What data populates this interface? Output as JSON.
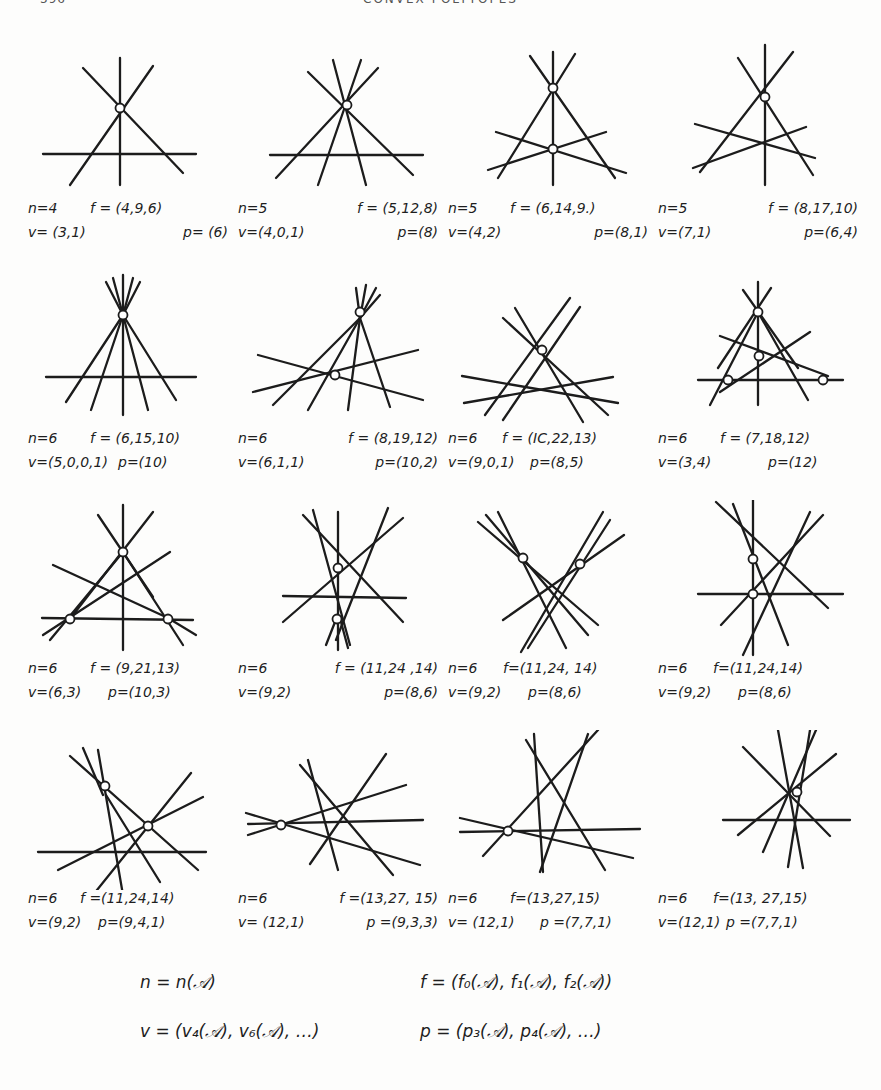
{
  "header": {
    "page_number": "396",
    "running_title": "CONVEX POLYTOPES"
  },
  "figures": [
    {
      "n": "n=4",
      "f": "f = (4,9,6)",
      "v": "v= (3,1)",
      "p": "p= (6)",
      "lines": [
        [
          45,
          115,
          160,
          115
        ],
        [
          95,
          20,
          95,
          160
        ],
        [
          50,
          40,
          165,
          125
        ],
        [
          125,
          40,
          40,
          145
        ]
      ],
      "points": [
        [
          95,
          68
        ]
      ]
    },
    {
      "n": "n=5",
      "f": "f = (5,12,8)",
      "v": "v=(4,0,1)",
      "p": "p=(8)",
      "lines": [
        [
          30,
          115,
          185,
          115
        ],
        [
          60,
          30,
          165,
          135
        ],
        [
          120,
          28,
          50,
          138
        ],
        [
          90,
          20,
          135,
          145
        ],
        [
          135,
          20,
          80,
          148
        ],
        [
          157,
          32,
          40,
          140
        ]
      ],
      "points": [
        [
          98,
          65
        ]
      ]
    },
    {
      "n": "n=5",
      "f": "f = (6,14,9.)",
      "v": "v=(4,2)",
      "p": "p=(8,1)",
      "lines": [
        [
          80,
          12,
          80,
          145
        ],
        [
          58,
          18,
          140,
          140
        ],
        [
          102,
          14,
          30,
          140
        ],
        [
          27,
          92,
          155,
          132
        ],
        [
          22,
          130,
          138,
          92
        ]
      ],
      "points": [
        [
          80,
          48
        ],
        [
          80,
          109
        ]
      ]
    },
    {
      "n": "n=5",
      "f": "f = (8,17,10)",
      "v": "v=(7,1)",
      "p": "p=(6,4)",
      "lines": [
        [
          95,
          5,
          95,
          145
        ],
        [
          70,
          18,
          155,
          135
        ],
        [
          122,
          12,
          40,
          132
        ],
        [
          35,
          84,
          155,
          118
        ],
        [
          33,
          128,
          147,
          87
        ]
      ],
      "points": [
        [
          95,
          58
        ]
      ]
    },
    {
      "n": "n=6",
      "f": "f = (6,15,10)",
      "v": "v=(5,0,0,1)",
      "p": "p=(10)",
      "lines": [
        [
          15,
          107,
          165,
          107
        ],
        [
          95,
          272,
          95,
          408
        ],
        [
          75,
          278,
          38,
          396
        ],
        [
          85,
          275,
          60,
          403
        ],
        [
          105,
          275,
          120,
          403
        ],
        [
          115,
          278,
          150,
          396
        ],
        [
          85,
          280,
          150,
          370
        ]
      ],
      "points": [
        [
          95,
          310
        ]
      ],
      "yoffset": -230
    },
    {
      "n": "n=6",
      "f": "f = (8,19,12)",
      "v": "v=(6,1,1)",
      "p": "p=(10,2)",
      "lines": [
        [
          215,
          370,
          360,
          345
        ],
        [
          230,
          353,
          390,
          395
        ],
        [
          332,
          280,
          270,
          400
        ],
        [
          332,
          280,
          245,
          408
        ],
        [
          332,
          280,
          307,
          408
        ],
        [
          332,
          280,
          355,
          403
        ]
      ],
      "points": [
        [
          332,
          308
        ],
        [
          297,
          370
        ]
      ],
      "xoffset": -210,
      "yoffset": -230
    },
    {
      "n": "n=6",
      "f": "f = (IC,22,13)",
      "v": "v=(9,0,1)",
      "p": "p=(8,5)",
      "lines": [
        [
          14,
          106,
          170,
          133
        ],
        [
          16,
          133,
          165,
          107
        ],
        [
          55,
          48,
          160,
          145
        ],
        [
          67,
          38,
          135,
          152
        ],
        [
          120,
          28,
          37,
          145
        ],
        [
          132,
          37,
          55,
          150
        ]
      ],
      "points": [
        [
          93,
          82
        ]
      ]
    },
    {
      "n": "n=6",
      "f": "f = (7,18,12)",
      "v": "v=(3,4)",
      "p": "p=(12)",
      "lines": [
        [
          88,
          12,
          88,
          135
        ],
        [
          72,
          20,
          118,
          92
        ],
        [
          105,
          20,
          55,
          98
        ],
        [
          70,
          68,
          183,
          103
        ],
        [
          58,
          120,
          155,
          62
        ],
        [
          35,
          110,
          150,
          110
        ],
        [
          45,
          135,
          113,
          42
        ],
        [
          130,
          130,
          63,
          42
        ]
      ],
      "points": [
        [
          88,
          42
        ],
        [
          88,
          86
        ],
        [
          63,
          110
        ],
        [
          160,
          110
        ]
      ]
    },
    {
      "n": "n=6",
      "f": "f = (9,21,13)",
      "v": "v=(6,3)",
      "p": "p=(10,3)",
      "lines": [
        [
          93,
          5,
          93,
          150
        ],
        [
          70,
          15,
          130,
          97
        ],
        [
          122,
          12,
          40,
          108
        ],
        [
          25,
          65,
          140,
          115
        ],
        [
          15,
          118,
          168,
          118
        ],
        [
          22,
          142,
          145,
          52
        ],
        [
          18,
          135,
          165,
          135
        ]
      ],
      "points": [
        [
          93,
          52
        ],
        [
          42,
          117
        ],
        [
          140,
          118
        ]
      ]
    },
    {
      "n": "n=6",
      "f": "f = (11,24,14)",
      "v": "v=(9,2)",
      "p": "p=(8,6)",
      "lines": [
        [
          247,
          32,
          342,
          118
        ],
        [
          270,
          15,
          325,
          145
        ],
        [
          312,
          12,
          298,
          150
        ],
        [
          325,
          15,
          300,
          145
        ],
        [
          383,
          18,
          247,
          120
        ],
        [
          240,
          95,
          372,
          98
        ],
        [
          330,
          5,
          330,
          150
        ]
      ],
      "points": [
        [
          312,
          67
        ],
        [
          310,
          117
        ]
      ],
      "xoffset": -210
    },
    {
      "n": "n=6",
      "f": "f = (11,24,14)",
      "v": "v=(9,2)",
      "p": "p=(8,6)",
      "lines": [
        [
          30,
          22,
          150,
          125
        ],
        [
          38,
          15,
          140,
          135
        ],
        [
          52,
          12,
          120,
          148
        ],
        [
          158,
          12,
          73,
          150
        ],
        [
          168,
          22,
          85,
          148
        ],
        [
          178,
          35,
          57,
          120
        ]
      ],
      "points": [
        [
          77,
          58
        ],
        [
          133,
          65
        ]
      ]
    },
    {
      "n": "n=6",
      "f": "f = (11,24,14)",
      "v": "v=(9,2)",
      "p": "p=(8,6)",
      "lines": [
        [
          55,
          4,
          48,
          155
        ],
        [
          18,
          2,
          185,
          108
        ],
        [
          40,
          4,
          115,
          145
        ],
        [
          150,
          10,
          90,
          155
        ],
        [
          168,
          14,
          50,
          125
        ],
        [
          30,
          94,
          185,
          94
        ]
      ],
      "points": [
        [
          83,
          58
        ],
        [
          83,
          94
        ]
      ],
      "xoffset": -30
    },
    {
      "n": "n=6",
      "f": "f = (11,24,14)",
      "v": "v=(9,2)",
      "p": "p=(8,6)",
      "lines": [
        [
          35,
          22,
          165,
          136
        ],
        [
          50,
          18,
          92,
          155
        ],
        [
          65,
          18,
          70,
          155
        ],
        [
          10,
          120,
          175,
          120
        ],
        [
          20,
          138,
          170,
          62
        ],
        [
          62,
          158,
          150,
          42
        ]
      ],
      "points": [
        [
          72,
          50
        ],
        [
          118,
          92
        ]
      ]
    },
    {
      "n": "n=6",
      "f": "f = (13,27,15)",
      "v": "v= (12,1)",
      "p": "p= (9,3,3)",
      "lines": [
        [
          10,
          78,
          185,
          78
        ],
        [
          10,
          93,
          185,
          70
        ],
        [
          12,
          68,
          145,
          127
        ],
        [
          105,
          18,
          120,
          145
        ],
        [
          95,
          25,
          185,
          140
        ],
        [
          80,
          135,
          185,
          30
        ]
      ],
      "points": [
        [
          47,
          83
        ]
      ],
      "xoffset": -210,
      "shift": 210
    },
    {
      "n": "n=6",
      "f": "f = (13,27,15)",
      "v": "v= (12,1) p =(7,7,1)",
      "p": "",
      "lines": [
        [
          12,
          95,
          192,
          87
        ],
        [
          12,
          82,
          185,
          118
        ],
        [
          35,
          118,
          150,
          -5
        ],
        [
          86,
          5,
          95,
          140
        ],
        [
          78,
          6,
          157,
          132
        ],
        [
          142,
          2,
          90,
          142
        ]
      ],
      "points": [
        [
          59,
          100
        ]
      ]
    },
    {
      "n": "n=6",
      "f": "f = (13, 27,15)",
      "v": "v= (12,1) p =(7,7,1)",
      "p": "",
      "lines": [
        [
          65,
          88,
          180,
          88
        ],
        [
          120,
          0,
          145,
          140
        ],
        [
          90,
          15,
          165,
          105
        ],
        [
          180,
          22,
          80,
          105
        ],
        [
          105,
          120,
          157,
          0
        ],
        [
          130,
          138,
          148,
          0
        ]
      ],
      "points": [
        [
          148,
          60
        ]
      ]
    }
  ],
  "labels": [
    [
      {
        "n": "n=4",
        "f": "f = (4,9,6)",
        "v": "v= (3,1)",
        "p": "p= (6)"
      },
      {
        "n": "n=5",
        "f": "f = (5,12,8)",
        "v": "v=(4,0,1)",
        "p": "p=(8)"
      },
      {
        "n": "n=5",
        "f": "f = (6,14,9.)",
        "v": "v=(4,2)",
        "p": "p=(8,1)"
      },
      {
        "n": "n=5",
        "f": "f = (8,17,10)",
        "v": "v=(7,1)",
        "p": "p=(6,4)"
      }
    ],
    [
      {
        "n": "n=6",
        "f": "f = (6,15,10)",
        "v": "v=(5,0,0,1)",
        "p": "p=(10)"
      },
      {
        "n": "n=6",
        "f": "f = (8,19,12)",
        "v": "v=(6,1,1)",
        "p": "p=(10,2)"
      },
      {
        "n": "n=6",
        "f": "f = (IC,22,13)",
        "v": "v=(9,0,1)",
        "p": "p=(8,5)"
      },
      {
        "n": "n=6",
        "f": "f = (7,18,12)",
        "v": "v=(3,4)",
        "p": "p=(12)"
      }
    ],
    [
      {
        "n": "n=6",
        "f": "f = (9,21,13)",
        "v": "v=(6,3)",
        "p": "p=(10,3)"
      },
      {
        "n": "n=6",
        "f": "f = (11,24 ,14)",
        "v": "v=(9,2)",
        "p": "p=(8,6)"
      },
      {
        "n": "n=6",
        "f": "f=(11,24, 14)",
        "v": "v=(9,2)",
        "p": "p=(8,6)"
      },
      {
        "n": "n=6",
        "f": "f=(11,24,14)",
        "v": "v=(9,2)",
        "p": "p=(8,6)"
      }
    ],
    [
      {
        "n": "n=6",
        "f": "f =(11,24,14)",
        "v": "v=(9,2)",
        "p": "p=(9,4,1)"
      },
      {
        "n": "n=6",
        "f": "f =(13,27, 15)",
        "v": "v= (12,1)",
        "p": "p =(9,3,3)"
      },
      {
        "n": "n=6",
        "f": "f=(13,27,15)",
        "v": "v= (12,1)",
        "p": "p =(7,7,1)"
      },
      {
        "n": "n=6",
        "f": "f=(13, 27,15)",
        "v": "v=(12,1)",
        "p": "p =(7,7,1)"
      }
    ]
  ],
  "legend": {
    "n_def": "n = n(𝒜)",
    "f_def": "f = (f₀(𝒜), f₁(𝒜), f₂(𝒜))",
    "v_def": "v = (v₄(𝒜), v₆(𝒜),   …)",
    "p_def": "p = (p₃(𝒜), p₄(𝒜),   …)"
  }
}
